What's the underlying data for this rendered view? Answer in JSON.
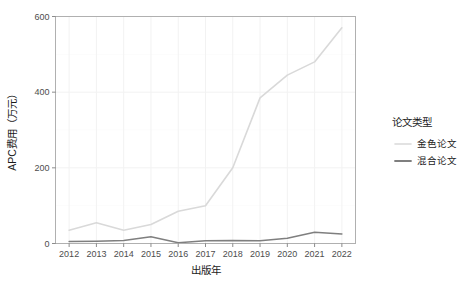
{
  "chart_data": {
    "type": "line",
    "title": "",
    "xlabel": "出版年",
    "ylabel": "APC费用（万元）",
    "x": [
      2012,
      2013,
      2014,
      2015,
      2016,
      2017,
      2018,
      2019,
      2020,
      2021,
      2022
    ],
    "categories": [
      "2012",
      "2013",
      "2014",
      "2015",
      "2016",
      "2017",
      "2018",
      "2019",
      "2020",
      "2021",
      "2022"
    ],
    "xlim": [
      2011.5,
      2022.5
    ],
    "ylim": [
      0,
      600
    ],
    "yticks": [
      0,
      200,
      400,
      600
    ],
    "ytick_labels": [
      "0",
      "200",
      "400",
      "600"
    ],
    "grid": true,
    "legend_position": "right",
    "legend_title": "论文类型",
    "series": [
      {
        "name": "金色论文",
        "color": "#d9d9d9",
        "values": [
          35,
          55,
          35,
          50,
          85,
          100,
          200,
          385,
          445,
          480,
          570
        ]
      },
      {
        "name": "混合论文",
        "color": "#7f7f7f",
        "values": [
          5,
          6,
          8,
          18,
          2,
          7,
          8,
          7,
          14,
          30,
          25
        ]
      }
    ]
  },
  "axes": {
    "x_title": "出版年",
    "y_title": "APC费用（万元）",
    "x_tick_labels": [
      "2012",
      "2013",
      "2014",
      "2015",
      "2016",
      "2017",
      "2018",
      "2019",
      "2020",
      "2021",
      "2022"
    ],
    "y_tick_labels": [
      "0",
      "200",
      "400",
      "600"
    ]
  },
  "legend": {
    "title": "论文类型",
    "items": [
      {
        "label": "金色论文",
        "color": "#d9d9d9"
      },
      {
        "label": "混合论文",
        "color": "#7f7f7f"
      }
    ]
  },
  "colors": {
    "panel_background": "#ffffff",
    "panel_border": "#b0b0b0",
    "gridline": "#f2f2f2",
    "text": "#1a1a1a",
    "tick_text": "#4d4d4d",
    "series_gold": "#d9d9d9",
    "series_hybrid": "#7f7f7f"
  }
}
